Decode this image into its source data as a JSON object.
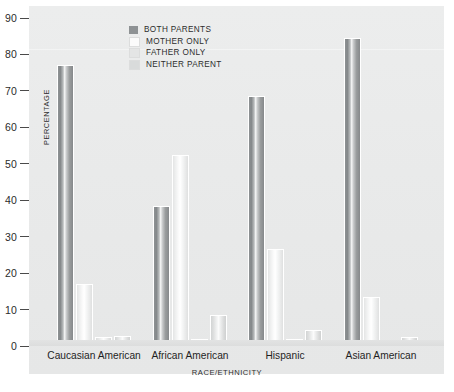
{
  "chart_data": {
    "type": "bar",
    "title": "",
    "xlabel": "RACE/ETHNICITY",
    "ylabel": "PERCENTAGE",
    "categories": [
      "Caucasian American",
      "African American",
      "Hispanic",
      "Asian American"
    ],
    "series": [
      {
        "name": "BOTH PARENTS",
        "color": "#8e9294",
        "values": [
          77.0,
          38.5,
          68.5,
          84.5
        ]
      },
      {
        "name": "MOTHER ONLY",
        "color": "#fbfbfb",
        "values": [
          17.0,
          52.5,
          26.5,
          13.5
        ]
      },
      {
        "name": "FATHER ONLY",
        "color": "#e4e5e5",
        "values": [
          2.5,
          2.0,
          2.0,
          1.0
        ]
      },
      {
        "name": "NEITHER PARENT",
        "color": "#d9dbdb",
        "values": [
          2.8,
          8.5,
          4.5,
          2.5
        ]
      }
    ],
    "ylim": [
      0,
      90
    ],
    "yticks": [
      90,
      80,
      70,
      60,
      50,
      40,
      30,
      20,
      10,
      0
    ],
    "ytick_labels": [
      "90",
      "80",
      "70",
      "60",
      "50",
      "40",
      "30",
      "20",
      "10",
      "0"
    ],
    "grid": false,
    "legend_position": "top-center-left",
    "legend_entries": [
      "BOTH PARENTS",
      "MOTHER ONLY",
      "FATHER ONLY",
      "NEITHER PARENT"
    ],
    "plot_background": "#e9eaea"
  }
}
